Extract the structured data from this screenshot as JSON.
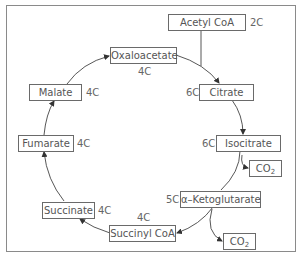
{
  "diagram": {
    "nodes": [
      {
        "id": "acetyl_coa",
        "label": "Acetyl CoA",
        "carbons": "2C"
      },
      {
        "id": "oxaloacetate",
        "label": "Oxaloacetate",
        "carbons": "4C"
      },
      {
        "id": "citrate",
        "label": "Citrate",
        "carbons": "6C"
      },
      {
        "id": "isocitrate",
        "label": "Isocitrate",
        "carbons": "6C"
      },
      {
        "id": "alpha_ketoglutarate",
        "label": "α–Ketoglutarate",
        "carbons": "5C"
      },
      {
        "id": "succinyl_coa",
        "label": "Succinyl CoA",
        "carbons": "4C"
      },
      {
        "id": "succinate",
        "label": "Succinate",
        "carbons": "4C"
      },
      {
        "id": "fumarate",
        "label": "Fumarate",
        "carbons": "4C"
      },
      {
        "id": "malate",
        "label": "Malate",
        "carbons": "4C"
      }
    ],
    "byproducts": [
      {
        "id": "co2_1",
        "label": "CO",
        "subscript": "2",
        "from": "isocitrate"
      },
      {
        "id": "co2_2",
        "label": "CO",
        "subscript": "2",
        "from": "alpha_ketoglutarate"
      }
    ],
    "edges": [
      {
        "from": "acetyl_coa",
        "to": "citrate"
      },
      {
        "from": "oxaloacetate",
        "to": "citrate"
      },
      {
        "from": "citrate",
        "to": "isocitrate"
      },
      {
        "from": "isocitrate",
        "to": "alpha_ketoglutarate"
      },
      {
        "from": "isocitrate",
        "to": "co2_1"
      },
      {
        "from": "alpha_ketoglutarate",
        "to": "succinyl_coa"
      },
      {
        "from": "alpha_ketoglutarate",
        "to": "co2_2"
      },
      {
        "from": "succinyl_coa",
        "to": "succinate"
      },
      {
        "from": "succinate",
        "to": "fumarate"
      },
      {
        "from": "fumarate",
        "to": "malate"
      },
      {
        "from": "malate",
        "to": "oxaloacetate"
      }
    ]
  }
}
